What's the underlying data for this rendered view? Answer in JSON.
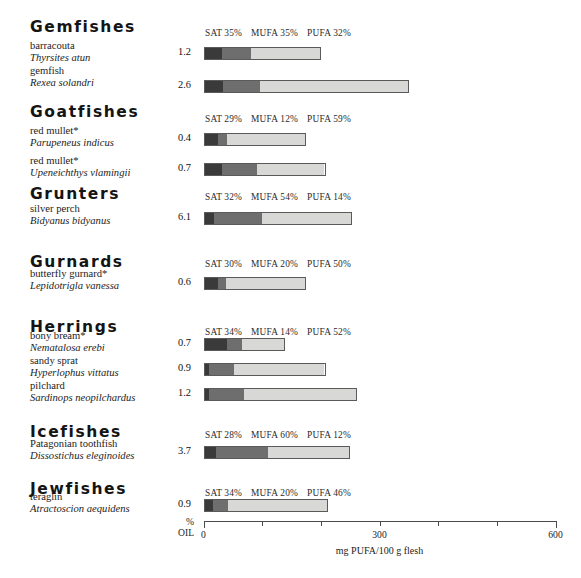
{
  "chart_data": {
    "type": "bar",
    "title": "",
    "xlabel": "mg PUFA/100 g flesh",
    "ylabel": "",
    "xlim": [
      0,
      600
    ],
    "xticks": [
      0,
      100,
      200,
      300,
      400,
      500,
      600
    ],
    "xtick_labels": [
      "0",
      "",
      "",
      "300",
      "",
      "",
      "600"
    ],
    "grid": false,
    "legend_position": "per-group header",
    "stack_order": [
      "SAT",
      "MUFA",
      "PUFA"
    ],
    "value_column_label": "% OIL",
    "series_colors": {
      "SAT": "#3a3a3a",
      "MUFA": "#6e6e6e",
      "PUFA": "#d8d8d6"
    },
    "groups": [
      {
        "name": "Gemfishes",
        "pct": {
          "sat": "35%",
          "mufa": "35%",
          "pufa": "32%"
        },
        "rows": [
          {
            "common": "barracouta",
            "latin": "Thyrsites atun",
            "oil": "1.2",
            "total_mg": 200,
            "sat_mg": 31,
            "mufa_mg": 49,
            "pufa_mg": 120
          },
          {
            "common": "gemfish",
            "latin": "Rexea solandri",
            "oil": "2.6",
            "total_mg": 350,
            "sat_mg": 31,
            "mufa_mg": 65,
            "pufa_mg": 254
          }
        ]
      },
      {
        "name": "Goatfishes",
        "pct": {
          "sat": "29%",
          "mufa": "12%",
          "pufa": "59%"
        },
        "rows": [
          {
            "common": "red mullet*",
            "latin": "Parupeneus indicus",
            "oil": "0.4",
            "total_mg": 174,
            "sat_mg": 24,
            "mufa_mg": 15,
            "pufa_mg": 135
          },
          {
            "common": "red mullet*",
            "latin": "Upeneichthys vlamingii",
            "oil": "0.7",
            "total_mg": 208,
            "sat_mg": 31,
            "mufa_mg": 60,
            "pufa_mg": 117
          }
        ]
      },
      {
        "name": "Grunters",
        "pct": {
          "sat": "32%",
          "mufa": "54%",
          "pufa": "14%"
        },
        "rows": [
          {
            "common": "silver perch",
            "latin": "Bidyanus bidyanus",
            "oil": "6.1",
            "total_mg": 253,
            "sat_mg": 17,
            "mufa_mg": 83,
            "pufa_mg": 153
          }
        ]
      },
      {
        "name": "Gurnards",
        "pct": {
          "sat": "30%",
          "mufa": "20%",
          "pufa": "50%"
        },
        "rows": [
          {
            "common": "butterfly gurnard*",
            "latin": "Lepidotrigla vanessa",
            "oil": "0.6",
            "total_mg": 174,
            "sat_mg": 24,
            "mufa_mg": 14,
            "pufa_mg": 136
          }
        ]
      },
      {
        "name": "Herrings",
        "pct": {
          "sat": "34%",
          "mufa": "14%",
          "pufa": "52%"
        },
        "rows": [
          {
            "common": "bony bream*",
            "latin": "Nematalosa erebi",
            "oil": "0.7",
            "total_mg": 139,
            "sat_mg": 39,
            "mufa_mg": 27,
            "pufa_mg": 73
          },
          {
            "common": "sandy sprat",
            "latin": "Hyperlophus vittatus",
            "oil": "0.9",
            "total_mg": 208,
            "sat_mg": 8,
            "mufa_mg": 44,
            "pufa_mg": 156
          },
          {
            "common": "pilchard",
            "latin": "Sardinops neopilchardus",
            "oil": "1.2",
            "total_mg": 261,
            "sat_mg": 8,
            "mufa_mg": 61,
            "pufa_mg": 192
          }
        ]
      },
      {
        "name": "Icefishes",
        "pct": {
          "sat": "28%",
          "mufa": "60%",
          "pufa": "12%"
        },
        "rows": [
          {
            "common": "Patagonian toothfish",
            "latin": "Dissostichus eleginoides",
            "oil": "3.7",
            "total_mg": 250,
            "sat_mg": 20,
            "mufa_mg": 90,
            "pufa_mg": 140
          }
        ]
      },
      {
        "name": "Jewfishes",
        "pct": {
          "sat": "34%",
          "mufa": "20%",
          "pufa": "46%"
        },
        "rows": [
          {
            "common": "teraglin",
            "latin": "Atractoscion aequidens",
            "oil": "0.9",
            "total_mg": 212,
            "sat_mg": 14,
            "mufa_mg": 27,
            "pufa_mg": 171
          }
        ]
      }
    ]
  },
  "labels": {
    "sat": "SAT",
    "mufa": "MUFA",
    "pufa": "PUFA",
    "oil_line1": "%",
    "oil_line2": "OIL",
    "x_title": "mg PUFA/100 g flesh"
  }
}
